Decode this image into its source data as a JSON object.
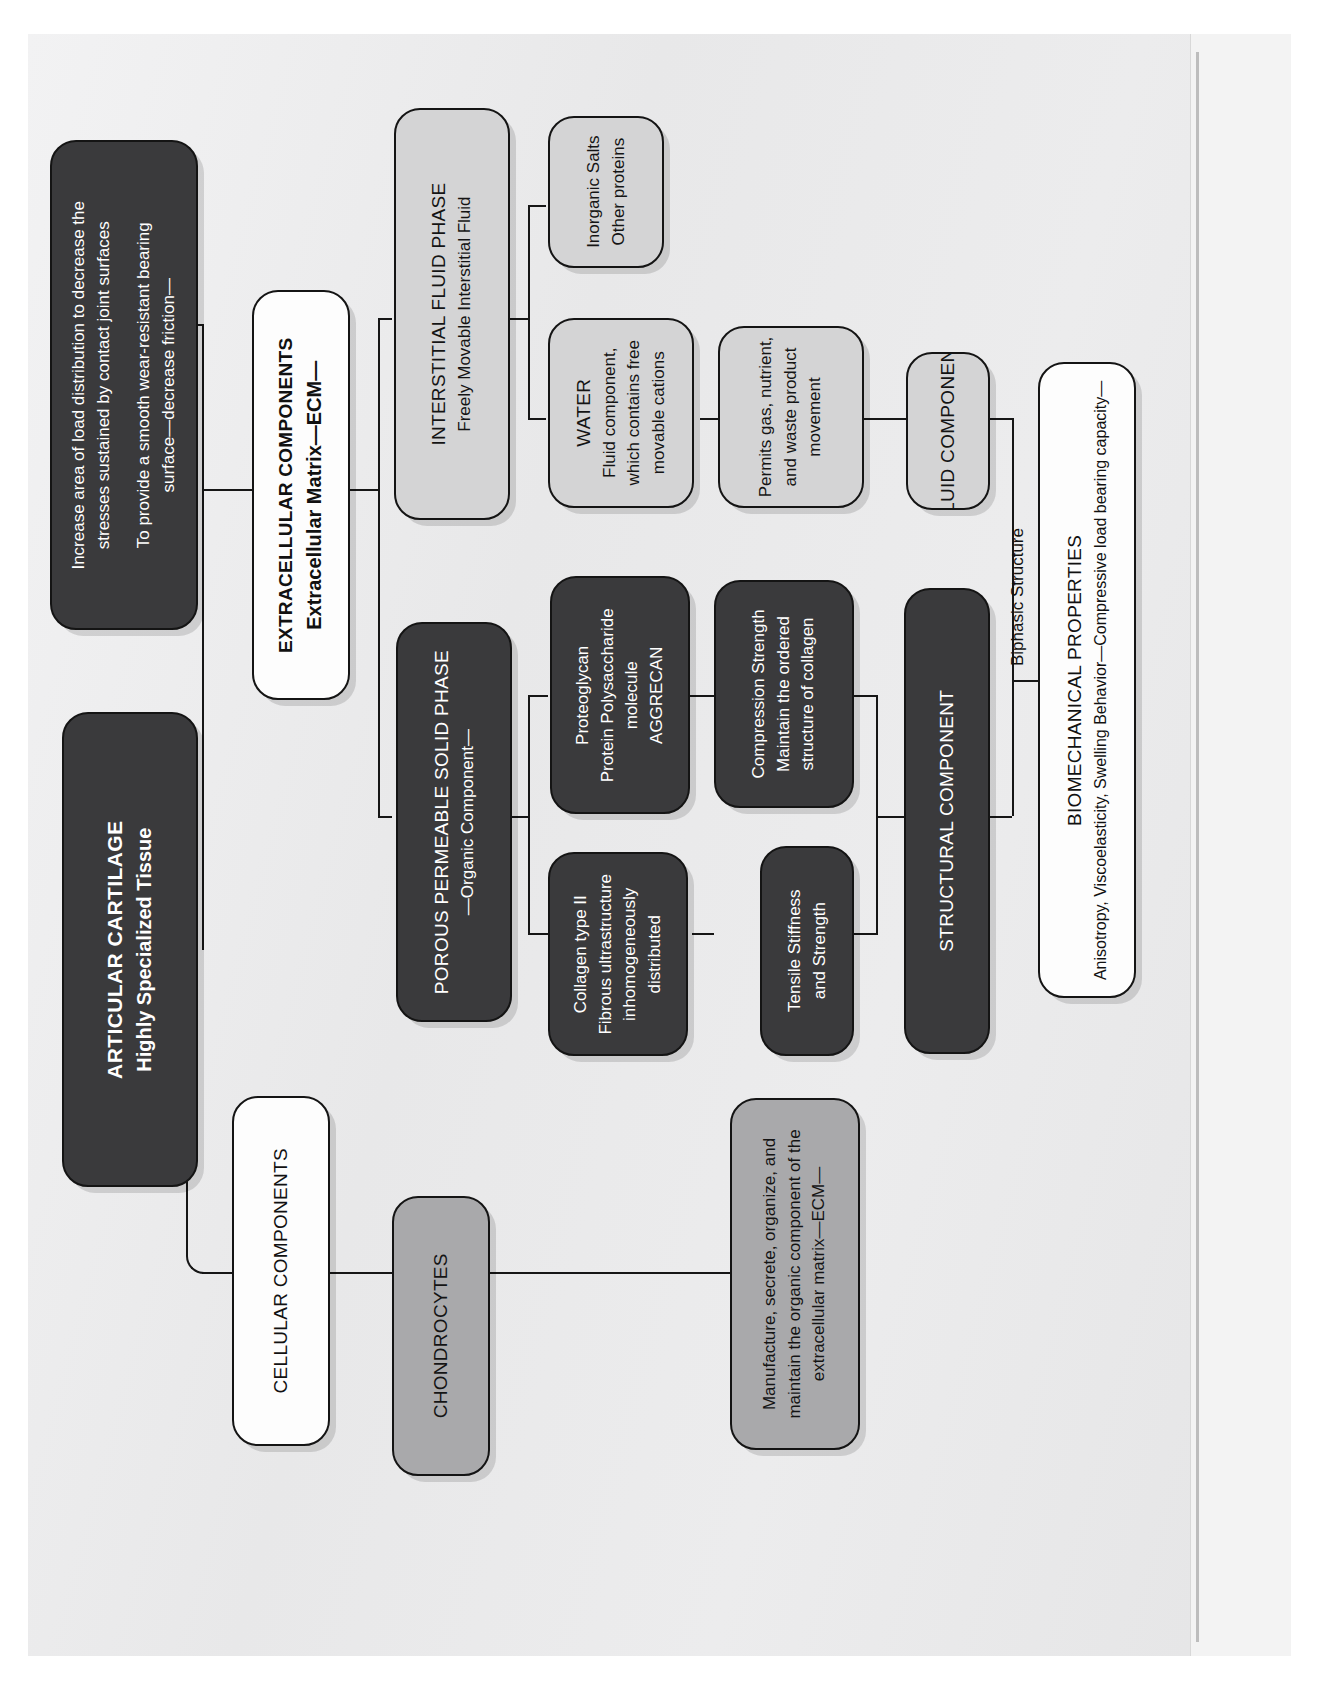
{
  "diagram": {
    "orientation": "rotated-90-ccw",
    "root": {
      "id": "articular-cartilage",
      "line1": "ARTICULAR CARTILAGE",
      "line2": "Highly Specialized Tissue",
      "style": "dark"
    },
    "functions_node": {
      "id": "functions",
      "line1": "Increase area of load distribution to decrease the",
      "line2": "stresses sustained by contact joint surfaces",
      "line3": "To provide a smooth wear-resistant bearing",
      "line4": "surface—decrease friction—",
      "style": "dark"
    },
    "extracellular": {
      "id": "extracellular-components",
      "line1": "EXTRACELLULAR COMPONENTS",
      "line2": "Extracellular Matrix—ECM—",
      "style": "white"
    },
    "cellular": {
      "id": "cellular-components",
      "line1": "CELLULAR COMPONENTS",
      "style": "white"
    },
    "chondrocytes": {
      "id": "chondrocytes",
      "line1": "CHONDROCYTES",
      "style": "mgray"
    },
    "chondrocyte_function": {
      "id": "chondrocyte-function",
      "line1": "Manufacture, secrete, organize, and",
      "line2": "maintain the organic component of the",
      "line3": "extracellular matrix—ECM—",
      "style": "mgray"
    },
    "interstitial": {
      "id": "interstitial-fluid-phase",
      "line1": "INTERSTITIAL FLUID PHASE",
      "line2": "Freely Movable Interstitial Fluid",
      "style": "lgray"
    },
    "salts": {
      "id": "inorganic-salts",
      "line1": "Inorganic Salts",
      "line2": "Other proteins",
      "style": "lgray"
    },
    "water": {
      "id": "water",
      "line1": "WATER",
      "line2": "Fluid component,",
      "line3": "which contains free",
      "line4": "movable cations",
      "style": "lgray"
    },
    "permits": {
      "id": "permits-movement",
      "line1": "Permits gas, nutrient,",
      "line2": "and waste product",
      "line3": "movement",
      "style": "lgray"
    },
    "fluid_component": {
      "id": "fluid-component",
      "line1": "FLUID COMPONENT",
      "style": "lgray"
    },
    "solid_phase": {
      "id": "porous-permeable-solid-phase",
      "line1": "POROUS PERMEABLE SOLID PHASE",
      "line2": "—Organic Component—",
      "style": "dark"
    },
    "proteoglycan": {
      "id": "proteoglycan",
      "line1": "Proteoglycan",
      "line2": "Protein Polysaccharide",
      "line3": "molecule",
      "line4": "AGGRECAN",
      "style": "dark"
    },
    "compression": {
      "id": "compression-strength",
      "line1": "Compression Strength",
      "line2": "Maintain the ordered",
      "line3": "structure of collagen",
      "style": "dark"
    },
    "collagen": {
      "id": "collagen-type-ii",
      "line1": "Collagen type II",
      "line2": "Fibrous ultrastructure",
      "line3": "inhomogeneously",
      "line4": "distributed",
      "style": "dark"
    },
    "tensile": {
      "id": "tensile-stiffness",
      "line1": "Tensile Stiffness",
      "line2": "and Strength",
      "style": "dark"
    },
    "structural_component": {
      "id": "structural-component",
      "line1": "STRUCTURAL COMPONENT",
      "style": "dark"
    },
    "biomechanical": {
      "id": "biomechanical-properties",
      "line1": "BIOMECHANICAL PROPERTIES",
      "line2": "Anisotropy, Viscoelasticity, Swelling Behavior—Compressive load bearing capacity—",
      "style": "white"
    },
    "edge_labels": {
      "biphasic": "Biphasic Structure"
    },
    "colors": {
      "dark_fill": "#3a3a3c",
      "white_fill": "#fdfdfd",
      "light_gray_fill": "#d4d4d5",
      "medium_gray_fill": "#a9a9ab",
      "stroke": "#141414",
      "page_background": "#ececed"
    }
  }
}
